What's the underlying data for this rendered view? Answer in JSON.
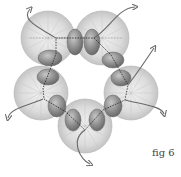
{
  "figure": {
    "caption": "fig 6",
    "colors": {
      "disc_fill": "#d9d9d9",
      "disc_stroke": "#a8a8a8",
      "oval_fill": "#8a8a8a",
      "thread": "#6a6a6a",
      "path": "#222222"
    },
    "discs": [
      {
        "cx": 48,
        "cy": 38,
        "r": 27
      },
      {
        "cx": 102,
        "cy": 38,
        "r": 27
      },
      {
        "cx": 131,
        "cy": 93,
        "r": 27
      },
      {
        "cx": 85,
        "cy": 126,
        "r": 27
      },
      {
        "cx": 41,
        "cy": 93,
        "r": 27
      }
    ]
  }
}
